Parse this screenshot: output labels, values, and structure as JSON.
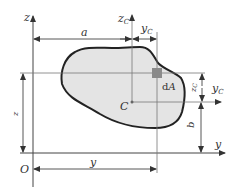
{
  "diagram": {
    "labels": {
      "z_axis": "z",
      "zc_axis_main": "z",
      "zc_axis_sub": "C",
      "a_dim": "a",
      "yc_top_main": "y",
      "yc_top_sub": "C",
      "zc_right_main": "z",
      "zc_right_sub": "C",
      "yc_axis_main": "y",
      "yc_axis_sub": "C",
      "centroid": "C",
      "dA_d": "d",
      "dA_A": "A",
      "b_dim": "b",
      "z_dim": "z",
      "y_axis": "y",
      "origin": "O",
      "y_dim": "y"
    },
    "colors": {
      "shape_fill": "#e4e4e4",
      "shape_stroke": "#222222",
      "element_fill": "#8a8a8a",
      "line": "#444444"
    }
  }
}
